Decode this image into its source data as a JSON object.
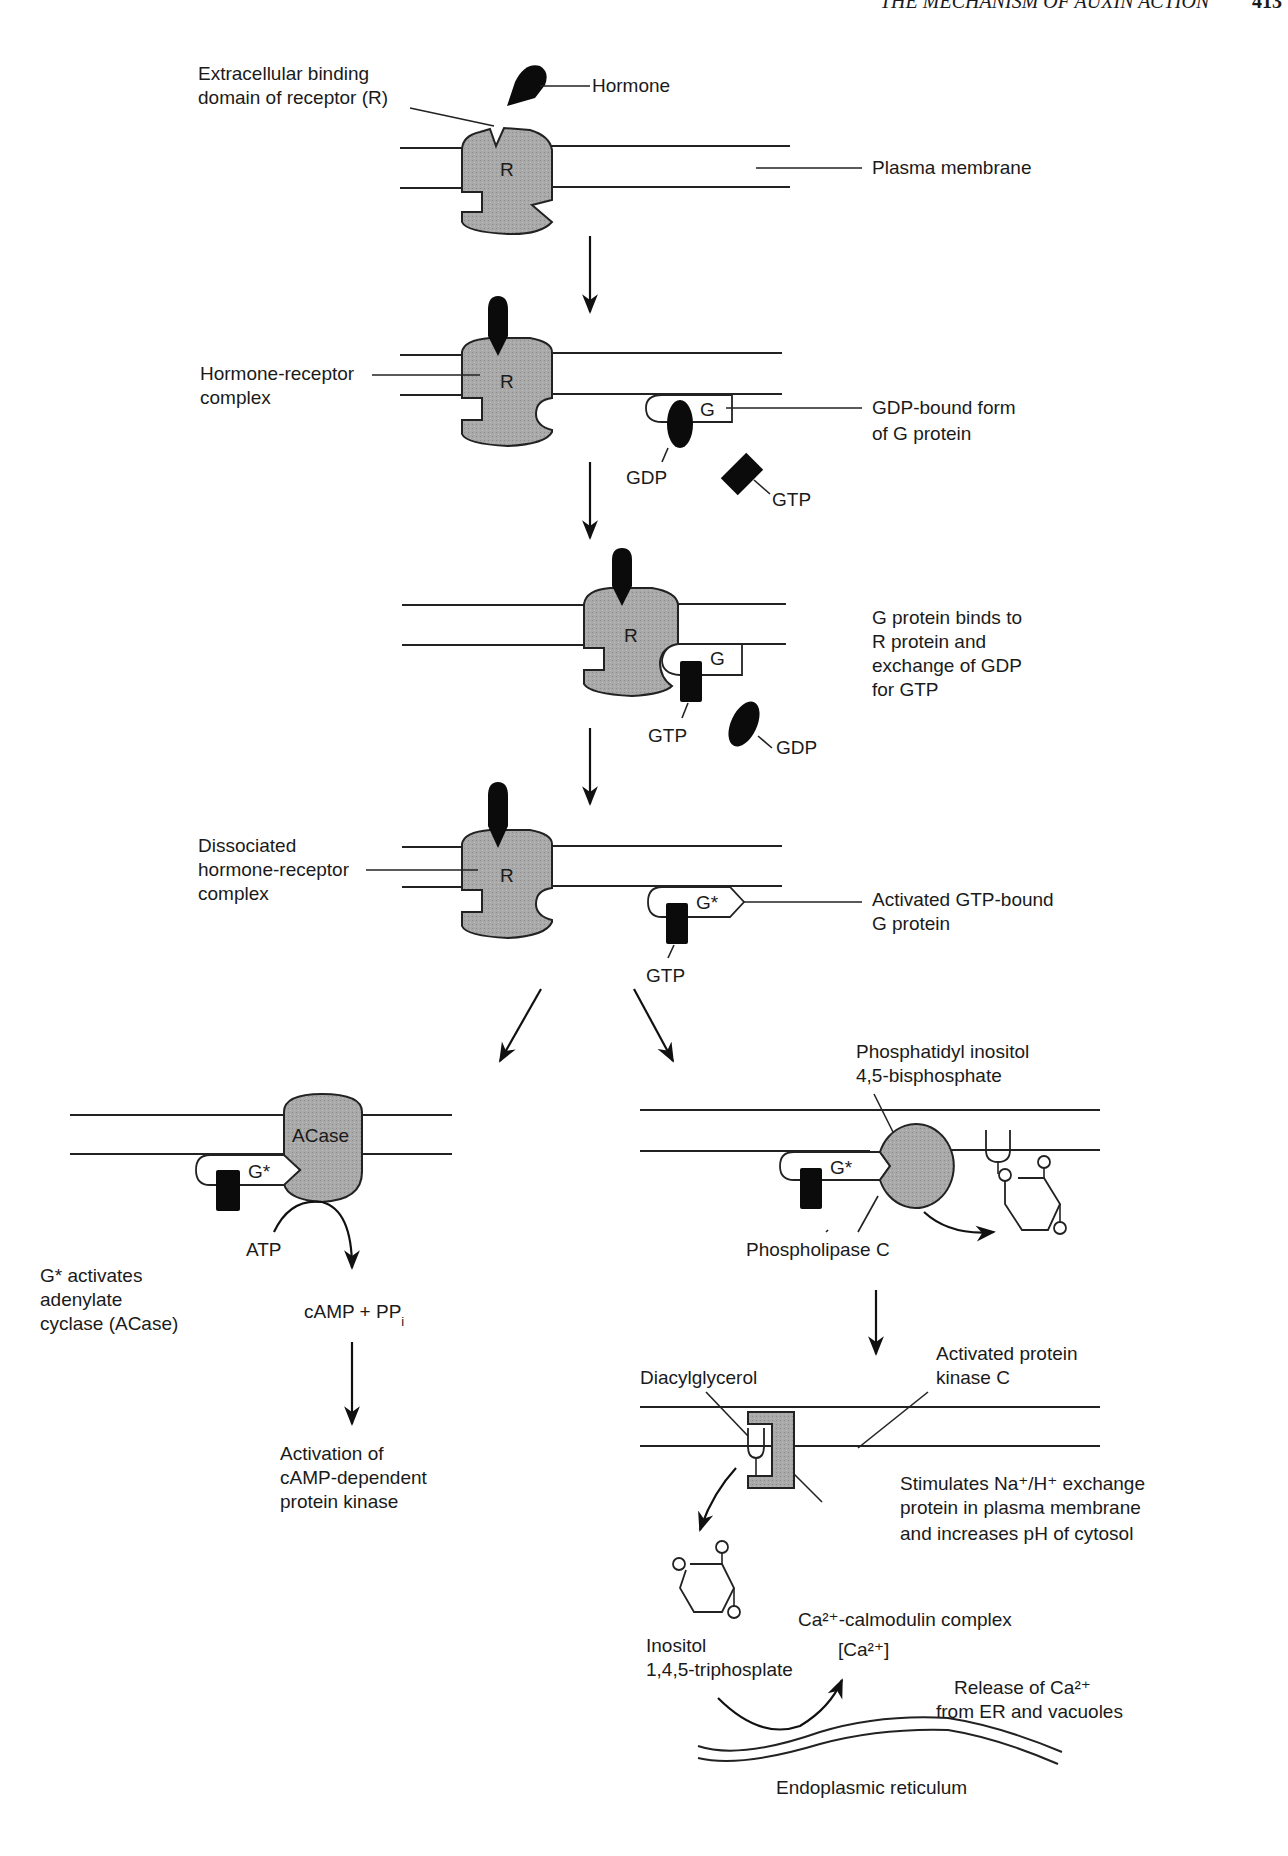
{
  "header": {
    "running_title": "THE MECHANISM OF AUXIN ACTION",
    "page_number": "413"
  },
  "colors": {
    "protein_fill": "#a9a9a9",
    "ligand": "#0b0b0b",
    "line": "#222222",
    "background": "#ffffff"
  },
  "step1": {
    "binding_domain_label": [
      "Extracellular binding",
      "domain of receptor (R)"
    ],
    "hormone_label": "Hormone",
    "membrane_label": "Plasma membrane",
    "receptor_letter": "R"
  },
  "step2": {
    "complex_label": [
      "Hormone-receptor",
      "complex"
    ],
    "receptor_letter": "R",
    "g_letter": "G",
    "gdp_form_label": [
      "GDP-bound form",
      "of G protein"
    ],
    "gdp_label": "GDP",
    "gtp_label": "GTP"
  },
  "step3": {
    "receptor_letter": "R",
    "g_letter": "G",
    "description": [
      "G protein binds to",
      "R protein and",
      "exchange of GDP",
      "for GTP"
    ],
    "gtp_label": "GTP",
    "gdp_label": "GDP"
  },
  "step4": {
    "dissociated_label": [
      "Dissociated",
      "hormone-receptor",
      "complex"
    ],
    "receptor_letter": "R",
    "g_star": "G*",
    "activated_label": [
      "Activated GTP-bound",
      "G protein"
    ],
    "gtp_label": "GTP"
  },
  "left_branch": {
    "acase_label": "ACase",
    "g_star": "G*",
    "atp_label": "ATP",
    "description": [
      "G* activates",
      "adenylate",
      "cyclase (ACase)"
    ],
    "product_label": "cAMP + PP",
    "product_subscript": "i",
    "outcome": [
      "Activation of",
      "cAMP-dependent",
      "protein kinase"
    ]
  },
  "right_branch": {
    "pip2_label": [
      "Phosphatidyl inositol",
      "4,5-bisphosphate"
    ],
    "g_star": "G*",
    "plc_label": "Phospholipase C",
    "dag_label": "Diacylglycerol",
    "pkc_label": [
      "Activated protein",
      "kinase C"
    ],
    "exchange_label": [
      "Stimulates Na⁺/H⁺ exchange",
      "protein in plasma membrane",
      "and increases pH of cytosol"
    ],
    "ip3_label": [
      "Inositol",
      "1,4,5-triphosplate"
    ],
    "calmodulin_label": "Ca²⁺-calmodulin complex",
    "ca_conc_label": "[Ca²⁺]",
    "release_label": [
      "Release of Ca²⁺",
      "from ER and vacuoles"
    ],
    "er_label": "Endoplasmic reticulum"
  }
}
